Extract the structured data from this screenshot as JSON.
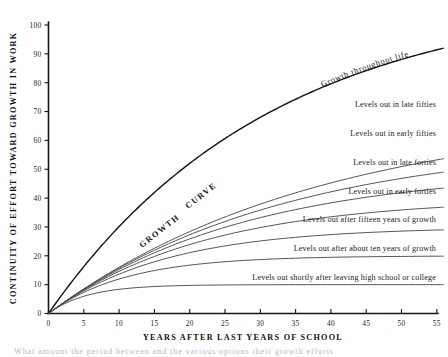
{
  "figure": {
    "title": "Continuity of Effort Toward Growth in Work",
    "footer_fragment": "What amount the period between and the various options their growth efforts"
  },
  "chart_data": {
    "type": "line",
    "title": "",
    "xlabel": "YEARS AFTER LAST YEARS OF SCHOOL",
    "ylabel": "CONTINUITY OF EFFORT TOWARD GROWTH IN WORK",
    "xlim": [
      0,
      56
    ],
    "ylim": [
      0,
      100
    ],
    "grid": false,
    "legend": "none",
    "xticks": [
      0,
      5,
      10,
      15,
      20,
      25,
      30,
      35,
      40,
      45,
      50,
      55
    ],
    "xticklabels": [
      "0",
      "5",
      "10",
      "15",
      "20",
      "25",
      "30",
      "35",
      "40",
      "45",
      "50",
      "55"
    ],
    "yticks": [
      0,
      10,
      20,
      30,
      40,
      50,
      60,
      70,
      80,
      90,
      100
    ],
    "yticklabels": [
      "0",
      "10",
      "20",
      "30",
      "40",
      "50",
      "60",
      "70",
      "80",
      "90",
      "100"
    ],
    "series": [
      {
        "name": "Growth throughout life",
        "annotation": "Growth throughout life",
        "plateau": null,
        "x": [
          0,
          5,
          10,
          15,
          20,
          25,
          30,
          35,
          40,
          45,
          50,
          55
        ],
        "values": [
          0,
          9,
          18,
          27,
          36,
          45,
          54,
          63,
          71,
          79,
          86,
          92
        ]
      },
      {
        "name": "Levels out in late fifties",
        "annotation": "Levels out in late fifties",
        "plateau": 70,
        "x": [
          0,
          5,
          10,
          15,
          20,
          25,
          30,
          35,
          40,
          45,
          50,
          55
        ],
        "values": [
          0,
          9,
          18,
          27,
          36,
          45,
          54,
          62,
          67,
          69.4,
          70,
          70
        ]
      },
      {
        "name": "Levels out in early fifties",
        "annotation": "Levels out in early fifties",
        "plateau": 60,
        "x": [
          0,
          5,
          10,
          15,
          20,
          25,
          30,
          35,
          40,
          45,
          50,
          55
        ],
        "values": [
          0,
          9,
          18,
          27,
          36,
          45,
          53,
          57.8,
          59.6,
          60,
          60,
          60
        ]
      },
      {
        "name": "Levels out in late forties",
        "annotation": "Levels out in late forties",
        "plateau": 50,
        "x": [
          0,
          5,
          10,
          15,
          20,
          25,
          30,
          35,
          40,
          45,
          50,
          55
        ],
        "values": [
          0,
          9,
          18,
          27,
          36,
          44,
          48.3,
          49.7,
          50,
          50,
          50,
          50
        ]
      },
      {
        "name": "Levels out in early forties",
        "annotation": "Levels out in early forties",
        "plateau": 40,
        "x": [
          0,
          5,
          10,
          15,
          20,
          25,
          30,
          35,
          40,
          45,
          50,
          55
        ],
        "values": [
          0,
          9,
          18,
          27,
          34.5,
          38.6,
          39.8,
          40,
          40,
          40,
          40,
          40
        ]
      },
      {
        "name": "Levels out after fifteen years of growth",
        "annotation": "Levels out after fifteen years of growth",
        "plateau": 30,
        "x": [
          0,
          5,
          10,
          15,
          20,
          25,
          30,
          35,
          40,
          45,
          50,
          55
        ],
        "values": [
          0,
          9,
          18,
          25.4,
          29,
          29.9,
          30,
          30,
          30,
          30,
          30,
          30
        ]
      },
      {
        "name": "Levels out after about ten years of growth",
        "annotation": "Levels out after about ten years of growth",
        "plateau": 20,
        "x": [
          0,
          5,
          10,
          15,
          20,
          25,
          30,
          35,
          40,
          45,
          50,
          55
        ],
        "values": [
          0,
          9,
          16.5,
          19.5,
          20,
          20,
          20,
          20,
          20,
          20,
          20,
          20
        ]
      },
      {
        "name": "Levels out shortly after leaving high school or college",
        "annotation": "Levels out shortly after leaving high school or college",
        "plateau": 10,
        "x": [
          0,
          5,
          10,
          15,
          20,
          25,
          30,
          35,
          40,
          45,
          50,
          55
        ],
        "values": [
          0,
          8.3,
          10,
          10,
          10,
          10,
          10,
          10,
          10,
          10,
          10,
          10
        ]
      }
    ],
    "annotations": [
      {
        "text": "GROWTH",
        "x": 15,
        "y": 30,
        "rotation": -37
      },
      {
        "text": "CURVE",
        "x": 21,
        "y": 41,
        "rotation": -37
      },
      {
        "text": "Growth throughout life",
        "x": 42,
        "y": 83,
        "rotation": -18
      }
    ],
    "colors": {
      "main_curve": "#161616",
      "branch_curve": "#4a4a4a",
      "axis": "#141414",
      "text": "#1a1a1a",
      "background": "#ffffff"
    }
  },
  "axis": {
    "x_title": "YEARS AFTER LAST YEARS OF SCHOOL",
    "y_title": "CONTINUITY OF EFFORT TOWARD GROWTH IN WORK"
  },
  "ticks": {
    "x": [
      "0",
      "5",
      "10",
      "15",
      "20",
      "25",
      "30",
      "35",
      "40",
      "45",
      "50",
      "55"
    ],
    "y": [
      "0",
      "10",
      "20",
      "30",
      "40",
      "50",
      "60",
      "70",
      "80",
      "90",
      "100"
    ]
  },
  "labels": {
    "growth_word": "GROWTH",
    "curve_word": "CURVE",
    "growth_life": "Growth throughout life",
    "plateaus": [
      "Levels out in late fifties",
      "Levels out in early fifties",
      "Levels out in late forties",
      "Levels out in early forties",
      "Levels out after fifteen years of growth",
      "Levels out after about ten years of growth",
      "Levels out shortly after leaving high school or college"
    ]
  }
}
